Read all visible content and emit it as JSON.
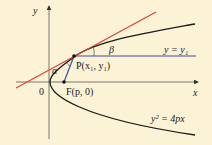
{
  "diagram": {
    "background": "#fcf3d6",
    "axes": {
      "x_label": "x",
      "y_label": "y",
      "origin_label": "0"
    },
    "curve": {
      "equation": "y² = 4px",
      "color": "#1a1a1a"
    },
    "point_P": {
      "label": "P(x₁, y₁)"
    },
    "focus_F": {
      "label": "F(p, 0)"
    },
    "horizontal_line": {
      "label": "y = y₁",
      "color": "#3a4fa8"
    },
    "tangent_line": {
      "color": "#e0403a"
    },
    "focal_segment": {
      "color": "#3a4fa8"
    },
    "angles": {
      "alpha": "α",
      "beta": "β"
    }
  }
}
